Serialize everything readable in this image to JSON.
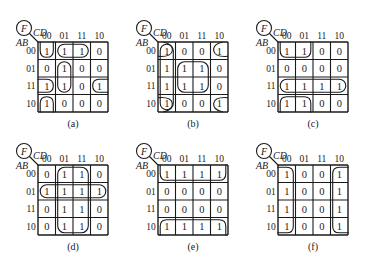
{
  "figure": {
    "var_label": "F",
    "col_var": "CD",
    "row_var": "AB",
    "col_headers": [
      "00",
      "01",
      "11",
      "10"
    ],
    "row_headers": [
      "00",
      "01",
      "11",
      "10"
    ],
    "line_color": "#1a1a1a"
  },
  "kmaps": [
    {
      "id": "a",
      "caption": "(a)",
      "x": 10,
      "y": 10,
      "cells": [
        [
          "1",
          "1",
          "1",
          "0"
        ],
        [
          "0",
          "1",
          "0",
          "0"
        ],
        [
          "1",
          "1",
          "0",
          "1"
        ],
        [
          "1",
          "0",
          "0",
          "0"
        ]
      ],
      "groups": [
        {
          "desc": "AB=00..? CD=00 U-shape top",
          "r0": 0,
          "c0": 0,
          "r1": 0,
          "c1": 0,
          "open": "top"
        },
        {
          "desc": "row00 CD=01,11",
          "r0": 0,
          "c0": 1,
          "r1": 0,
          "c1": 2,
          "open": "none"
        },
        {
          "desc": "col01 rows01,11",
          "r0": 1,
          "c0": 1,
          "r1": 2,
          "c1": 1,
          "open": "none"
        },
        {
          "desc": "row11 wrap left",
          "r0": 2,
          "c0": 0,
          "r1": 2,
          "c1": 0,
          "open": "left"
        },
        {
          "desc": "row11 wrap right",
          "r0": 2,
          "c0": 3,
          "r1": 2,
          "c1": 3,
          "open": "right"
        },
        {
          "desc": "row10 col00 bottom",
          "r0": 3,
          "c0": 0,
          "r1": 3,
          "c1": 0,
          "open": "bottom"
        }
      ]
    },
    {
      "id": "b",
      "caption": "(b)",
      "x": 130,
      "y": 10,
      "cells": [
        [
          "1",
          "0",
          "0",
          "1"
        ],
        [
          "1",
          "1",
          "1",
          "0"
        ],
        [
          "1",
          "1",
          "1",
          "0"
        ],
        [
          "1",
          "0",
          "0",
          "1"
        ]
      ],
      "groups": [
        {
          "desc": "column 00",
          "r0": 0,
          "c0": 0,
          "r1": 3,
          "c1": 0,
          "open": "none"
        },
        {
          "desc": "center quad",
          "r0": 1,
          "c0": 1,
          "r1": 2,
          "c1": 2,
          "open": "none"
        },
        {
          "desc": "corner TL",
          "r0": 0,
          "c0": 0,
          "r1": 0,
          "c1": 0,
          "open": "topleft"
        },
        {
          "desc": "corner TR",
          "r0": 0,
          "c0": 3,
          "r1": 0,
          "c1": 3,
          "open": "topright"
        },
        {
          "desc": "corner BL",
          "r0": 3,
          "c0": 0,
          "r1": 3,
          "c1": 0,
          "open": "bottomleft"
        },
        {
          "desc": "corner BR",
          "r0": 3,
          "c0": 3,
          "r1": 3,
          "c1": 3,
          "open": "bottomright"
        }
      ]
    },
    {
      "id": "c",
      "caption": "(c)",
      "x": 250,
      "y": 10,
      "cells": [
        [
          "1",
          "1",
          "0",
          "0"
        ],
        [
          "0",
          "0",
          "0",
          "0"
        ],
        [
          "1",
          "1",
          "1",
          "1"
        ],
        [
          "1",
          "1",
          "0",
          "0"
        ]
      ],
      "groups": [
        {
          "desc": "row00 cols00-01 top",
          "r0": 0,
          "c0": 0,
          "r1": 0,
          "c1": 1,
          "open": "top"
        },
        {
          "desc": "row11 full",
          "r0": 2,
          "c0": 0,
          "r1": 2,
          "c1": 3,
          "open": "none"
        },
        {
          "desc": "row10 cols00-01 bottom",
          "r0": 3,
          "c0": 0,
          "r1": 3,
          "c1": 1,
          "open": "bottom"
        }
      ]
    },
    {
      "id": "d",
      "caption": "(d)",
      "x": 10,
      "y": 133,
      "cells": [
        [
          "0",
          "1",
          "1",
          "0"
        ],
        [
          "1",
          "1",
          "1",
          "1"
        ],
        [
          "0",
          "1",
          "1",
          "0"
        ],
        [
          "0",
          "1",
          "1",
          "0"
        ]
      ],
      "groups": [
        {
          "desc": "cols 01-11 full",
          "r0": 0,
          "c0": 1,
          "r1": 3,
          "c1": 2,
          "open": "none"
        },
        {
          "desc": "row01 full",
          "r0": 1,
          "c0": 0,
          "r1": 1,
          "c1": 3,
          "open": "none"
        }
      ]
    },
    {
      "id": "e",
      "caption": "(e)",
      "x": 130,
      "y": 133,
      "cells": [
        [
          "1",
          "1",
          "1",
          "1"
        ],
        [
          "0",
          "0",
          "0",
          "0"
        ],
        [
          "0",
          "0",
          "0",
          "0"
        ],
        [
          "1",
          "1",
          "1",
          "1"
        ]
      ],
      "groups": [
        {
          "desc": "row00 top",
          "r0": 0,
          "c0": 0,
          "r1": 0,
          "c1": 3,
          "open": "top"
        },
        {
          "desc": "row10 bottom",
          "r0": 3,
          "c0": 0,
          "r1": 3,
          "c1": 3,
          "open": "bottom"
        }
      ]
    },
    {
      "id": "f",
      "caption": "(f)",
      "x": 250,
      "y": 133,
      "cells": [
        [
          "1",
          "0",
          "0",
          "1"
        ],
        [
          "1",
          "0",
          "0",
          "1"
        ],
        [
          "1",
          "0",
          "0",
          "1"
        ],
        [
          "1",
          "0",
          "0",
          "1"
        ]
      ],
      "groups": [
        {
          "desc": "col00 left",
          "r0": 0,
          "c0": 0,
          "r1": 3,
          "c1": 0,
          "open": "left"
        },
        {
          "desc": "col10 right",
          "r0": 0,
          "c0": 3,
          "r1": 3,
          "c1": 3,
          "open": "right"
        }
      ]
    }
  ]
}
